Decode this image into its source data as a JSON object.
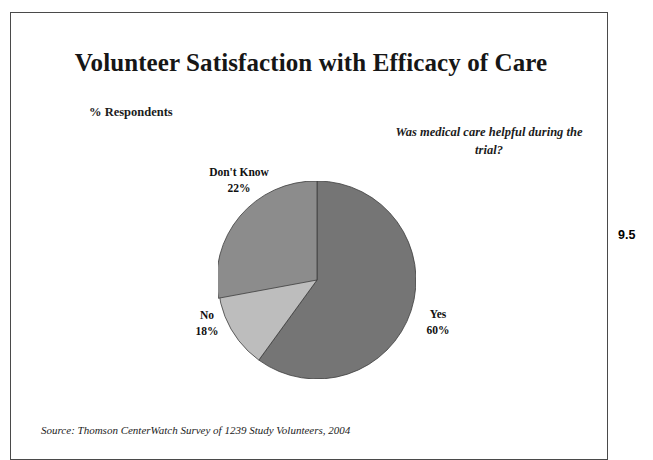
{
  "slide": {
    "title": "Volunteer Satisfaction with Efficacy of Care",
    "units_label": "% Respondents",
    "question": "Was medical care helpful during the trial?",
    "source": "Source: Thomson CenterWatch Survey of 1239 Study Volunteers, 2004",
    "page_number": "9.5"
  },
  "labels": {
    "dont_know_name": "Don't Know",
    "dont_know_pct": "22%",
    "no_name": "No",
    "no_pct": "18%",
    "yes_name": "Yes",
    "yes_pct": "60%"
  },
  "colors": {
    "yes": "#757575",
    "no": "#bdbdbd",
    "dont_know": "#8c8c8c",
    "slice_outline": "#3d3d3d",
    "frame": "#4a4a4a",
    "text": "#1a1a1a",
    "background": "#ffffff"
  },
  "chart_data": {
    "type": "pie",
    "title": "Volunteer Satisfaction with Efficacy of Care",
    "subtitle": "% Respondents",
    "annotation": "Was medical care helpful during the trial?",
    "source": "Source: Thomson CenterWatch Survey of 1239 Study Volunteers, 2004",
    "sample_size": 1239,
    "units": "percent of respondents",
    "legend_position": "none-inline-callouts",
    "start_angle_deg": 0,
    "direction": "clockwise",
    "categories": [
      "Yes",
      "No",
      "Don't Know"
    ],
    "values": [
      60,
      18,
      22
    ],
    "slice_colors": [
      "#757575",
      "#bdbdbd",
      "#8c8c8c"
    ],
    "slices": [
      {
        "label": "Yes",
        "value": 60,
        "display": "60%",
        "color": "#757575",
        "start_deg": 0,
        "end_deg": 216
      },
      {
        "label": "No",
        "value": 18,
        "display": "18%",
        "color": "#bdbdbd",
        "start_deg": 216,
        "end_deg": 280.8
      },
      {
        "label": "Don't Know",
        "value": 22,
        "display": "22%",
        "color": "#8c8c8c",
        "start_deg": 280.8,
        "end_deg": 360
      }
    ]
  }
}
